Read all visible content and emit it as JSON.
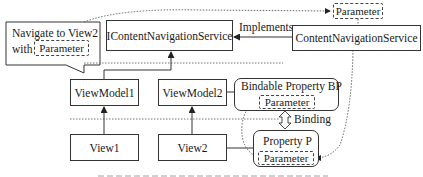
{
  "diagram": {
    "callout": {
      "line1": "Navigate to View2",
      "line2_prefix": "with",
      "parameter": "Parameter"
    },
    "nodes": {
      "icontent_nav_service": "IContentNavigationService",
      "content_nav_service": "ContentNavigationService",
      "parameter_top": "Parameter",
      "viewmodel1": "ViewModel1",
      "viewmodel2": "ViewModel2",
      "view1": "View1",
      "view2": "View2",
      "bindable_property": "Bindable Property BP",
      "bindable_parameter": "Parameter",
      "property_p": "Property P",
      "property_parameter": "Parameter"
    },
    "edges": {
      "implements_label": "Implements",
      "binding_label": "Binding"
    },
    "colors": {
      "stroke": "#333333",
      "background": "#ffffff"
    }
  }
}
